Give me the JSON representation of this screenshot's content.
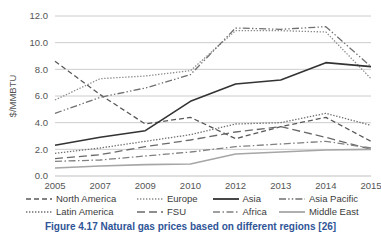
{
  "figure": {
    "caption": "Figure 4.17  Natural gas prices based on different regions [26]"
  },
  "chart_data": {
    "type": "line",
    "title": "",
    "xlabel": "",
    "ylabel": "$/MMBTU",
    "categories": [
      "2005",
      "2007",
      "2009",
      "2010",
      "2012",
      "2013",
      "2014",
      "2015"
    ],
    "ylim": [
      0.0,
      12.0
    ],
    "ytick_step": 2.0,
    "ytick_labels": [
      "0.0",
      "2.0",
      "4.0",
      "6.0",
      "8.0",
      "10.0",
      "12.0"
    ],
    "grid": "horizontal",
    "legend_position": "bottom",
    "series": [
      {
        "name": "North America",
        "style": "dashed",
        "color": "#595959",
        "values": [
          8.6,
          6.1,
          3.9,
          4.4,
          2.8,
          3.7,
          4.4,
          2.6
        ]
      },
      {
        "name": "Latin America",
        "style": "dotted",
        "color": "#6e6e6e",
        "values": [
          1.7,
          2.1,
          2.6,
          3.1,
          3.9,
          4.0,
          4.7,
          3.8
        ]
      },
      {
        "name": "Europe",
        "style": "dotted",
        "color": "#8c8c8c",
        "values": [
          5.7,
          7.3,
          7.5,
          7.9,
          10.9,
          10.9,
          10.8,
          7.3
        ]
      },
      {
        "name": "FSU",
        "style": "long-dashed",
        "color": "#6a6a6a",
        "values": [
          1.3,
          1.6,
          2.2,
          2.7,
          3.3,
          3.7,
          2.9,
          2.0
        ]
      },
      {
        "name": "Asia",
        "style": "solid",
        "color": "#333333",
        "values": [
          2.3,
          2.9,
          3.4,
          5.6,
          6.9,
          7.2,
          8.5,
          8.2
        ]
      },
      {
        "name": "Africa",
        "style": "dash-dot",
        "color": "#808080",
        "values": [
          1.1,
          1.2,
          1.5,
          1.8,
          2.2,
          2.4,
          2.6,
          2.1
        ]
      },
      {
        "name": "Asia Pacific",
        "style": "dash-dot-dot",
        "color": "#707070",
        "values": [
          4.7,
          5.9,
          6.6,
          7.6,
          11.1,
          11.0,
          11.2,
          8.2
        ]
      },
      {
        "name": "Middle East",
        "style": "solid",
        "color": "#a6a6a6",
        "values": [
          0.6,
          0.75,
          0.85,
          0.9,
          1.65,
          1.8,
          1.95,
          2.0
        ]
      }
    ]
  },
  "legend": {
    "rows": [
      [
        {
          "name": "North America",
          "style": "dashed",
          "color": "#595959"
        },
        {
          "name": "Europe",
          "style": "dotted",
          "color": "#8c8c8c"
        },
        {
          "name": "Asia",
          "style": "solid",
          "color": "#333333"
        },
        {
          "name": "Asia Pacific",
          "style": "dash-dot-dot",
          "color": "#707070"
        }
      ],
      [
        {
          "name": "Latin America",
          "style": "dotted",
          "color": "#6e6e6e"
        },
        {
          "name": "FSU",
          "style": "long-dashed",
          "color": "#6a6a6a"
        },
        {
          "name": "Africa",
          "style": "dash-dot",
          "color": "#808080"
        },
        {
          "name": "Middle East",
          "style": "solid",
          "color": "#a6a6a6"
        }
      ]
    ]
  }
}
